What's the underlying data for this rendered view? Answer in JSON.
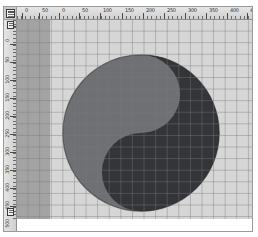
{
  "window": {
    "title": "Image Editor Canvas",
    "background_color": "#ffffff"
  },
  "rulers": {
    "unit": "px",
    "corner_widget": "guide-origin-marker",
    "horizontal": {
      "name": "horizontal-ruler",
      "labels": [
        "0",
        "50",
        "0",
        "50",
        "100",
        "150",
        "200",
        "250",
        "300",
        "350",
        "400",
        "450"
      ],
      "positions": [
        8,
        25,
        45,
        65,
        86,
        108,
        129,
        150,
        171,
        192,
        213,
        233
      ],
      "major_step_px": 21,
      "minor_per_major": 5
    },
    "vertical": {
      "name": "vertical-ruler",
      "labels": [
        "0",
        "50",
        "100",
        "150",
        "200",
        "250",
        "300",
        "350",
        "400",
        "450",
        "500",
        "550"
      ],
      "positions": [
        6,
        24,
        42,
        60,
        78,
        96,
        114,
        132,
        150,
        168,
        186,
        196
      ],
      "major_step_px": 18,
      "minor_per_major": 5
    }
  },
  "canvas": {
    "name": "drawing-canvas",
    "background_color": "#d6d6d6",
    "grid": {
      "visible": true,
      "spacing_px": 11.6,
      "line_color": "#787878"
    },
    "side_band": {
      "name": "left-gray-band",
      "color": "#a3a3a3",
      "width_px": 33
    },
    "artwork": {
      "name": "yin-yang-symbol",
      "type": "taegeuk",
      "diameter_px": 158,
      "dark_color": "#333538",
      "light_color": "#6e7073",
      "outline_color": "#2a2c2e",
      "rotation_deg": 0,
      "description": "Yin-yang circle: dark half upper-right, medium gray half lower-left, S-shaped divider"
    }
  },
  "guides": {
    "vertical_markers": [
      {
        "name": "guide-marker-top",
        "y_px": 1
      },
      {
        "name": "guide-marker-bottom",
        "y_px": 188
      }
    ]
  }
}
